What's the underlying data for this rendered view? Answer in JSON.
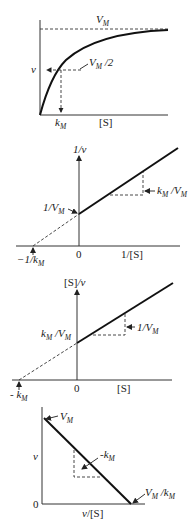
{
  "figure": {
    "panels": [
      {
        "name": "michaelis-menten",
        "top_label": "V_M",
        "top_label_main": "V",
        "top_label_sub": "M",
        "half_label_main": "V",
        "half_label_sub": "M",
        "half_label_tail": " /2",
        "y_label": "v",
        "km_main": "k",
        "km_sub": "M",
        "x_label": "[S]"
      },
      {
        "name": "lineweaver-burk",
        "y_label": "1/v",
        "intercept_main": "1/V",
        "intercept_sub": "M",
        "slope_k": "k",
        "slope_k_sub": "M",
        "slope_mid": " /V",
        "slope_v_sub": "M",
        "x_intercept_main": "−1/k",
        "x_intercept_sub": "M",
        "origin": "0",
        "x_label": "1/[S]"
      },
      {
        "name": "hanes-woolf",
        "y_label": "[S]/v",
        "intercept_k": "k",
        "intercept_k_sub": "M",
        "intercept_mid": " /V",
        "intercept_v_sub": "M",
        "slope_main": "1/V",
        "slope_sub": "M",
        "x_intercept_main": "- k",
        "x_intercept_sub": "M",
        "origin": "0",
        "x_label": "[S]"
      },
      {
        "name": "eadie-hofstee",
        "y_label": "v",
        "top_main": "V",
        "top_sub": "M",
        "slope_main": "-k",
        "slope_sub": "M",
        "x_intercept_v": "V",
        "x_intercept_v_sub": "M",
        "x_intercept_mid": " /k",
        "x_intercept_k_sub": "M",
        "origin": "0",
        "x_label": "v/[S]"
      }
    ]
  }
}
